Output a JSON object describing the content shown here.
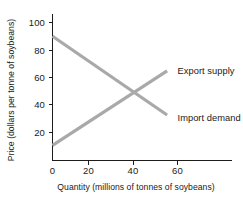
{
  "chart_data": {
    "type": "line",
    "title": "",
    "xlabel": "Quantity (millions of tonnes of soybeans)",
    "ylabel": "Price (dollars per tonne of soybeans)",
    "xlim": [
      0,
      80
    ],
    "ylim": [
      0,
      108
    ],
    "grid": false,
    "legend_position": "inline-right",
    "x_ticks": [
      {
        "value": 0,
        "label": "0"
      },
      {
        "value": 20,
        "label": "20"
      },
      {
        "value": 40,
        "label": "40"
      },
      {
        "value": 60,
        "label": "60"
      }
    ],
    "y_ticks": [
      {
        "value": 0,
        "label": "0"
      },
      {
        "value": 20,
        "label": "20"
      },
      {
        "value": 40,
        "label": "40"
      },
      {
        "value": 60,
        "label": "60"
      },
      {
        "value": 80,
        "label": "80"
      },
      {
        "value": 100,
        "label": "100"
      }
    ],
    "series": [
      {
        "name": "Import demand",
        "label": "Import demand",
        "color": "#a9a9a9",
        "points": [
          {
            "x": 0,
            "y": 90
          },
          {
            "x": 55,
            "y": 33
          }
        ]
      },
      {
        "name": "Export supply",
        "label": "Export supply",
        "color": "#a9a9a9",
        "points": [
          {
            "x": 0,
            "y": 11
          },
          {
            "x": 55,
            "y": 65
          }
        ]
      }
    ],
    "annotations": [
      {
        "name": "equilibrium",
        "x": 40,
        "y": 48,
        "label": ""
      }
    ]
  },
  "labels": {
    "export_supply": "Export supply",
    "import_demand": "Import demand",
    "y_axis_title": "Price (dollars per tonne of soybeans)",
    "x_axis_title": "Quantity (millions of tonnes of soybeans)",
    "y_tick_100": "100",
    "y_tick_80": "80",
    "y_tick_60": "60",
    "y_tick_40": "40",
    "y_tick_20": "20",
    "x_tick_0": "0",
    "x_tick_20": "20",
    "x_tick_40": "40",
    "x_tick_60": "60"
  },
  "colors": {
    "series": "#a9a9a9",
    "axis": "#1c1c1c",
    "text": "#1a1a1a",
    "background": "#ffffff"
  }
}
